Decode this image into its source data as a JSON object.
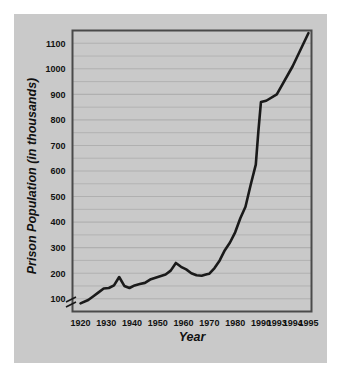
{
  "figure": {
    "background_color": "#ffffff",
    "panel_color": "#c9c9c9",
    "plot_background_color": "#ffffff",
    "frame_color": "#4a4a4a",
    "gridline_color": "#b0b0b0",
    "line_color": "#1a1a1a",
    "axis_break_note": "y-axis broken below 100"
  },
  "chart_data": {
    "type": "line",
    "title": "",
    "xlabel": "Year",
    "ylabel": "Prison Population (in thousands)",
    "xlim": [
      1920,
      1995
    ],
    "ylim": [
      50,
      1150
    ],
    "grid": true,
    "grid_interval": 50,
    "legend": "none",
    "y_tick_labels": [
      "1100",
      "1000",
      "900",
      "800",
      "700",
      "600",
      "500",
      "400",
      "300",
      "200",
      "100"
    ],
    "y_ticks": [
      1100,
      1000,
      900,
      800,
      700,
      600,
      500,
      400,
      300,
      200,
      100
    ],
    "x_tick_labels": [
      "1920",
      "1930",
      "1940",
      "1950",
      "1960",
      "1970",
      "1980",
      "1990",
      "1993",
      "1994",
      "1995"
    ],
    "x_ticks": [
      1920,
      1930,
      1940,
      1950,
      1960,
      1970,
      1980,
      1990,
      1993,
      1994,
      1995
    ],
    "x_axis_scale_note": "non-uniform: 1920-1990 evenly spaced by decade, then 1993, 1994, 1995 spaced as single years",
    "series": [
      {
        "name": "Prison Population",
        "x": [
          1920,
          1923,
          1925,
          1927,
          1929,
          1931,
          1933,
          1935,
          1937,
          1939,
          1941,
          1943,
          1945,
          1947,
          1950,
          1953,
          1955,
          1957,
          1959,
          1961,
          1963,
          1965,
          1967,
          1969,
          1970,
          1972,
          1974,
          1976,
          1978,
          1980,
          1982,
          1984,
          1986,
          1988,
          1989,
          1990,
          1991,
          1993,
          1994,
          1995
        ],
        "y": [
          82,
          95,
          110,
          125,
          140,
          142,
          152,
          185,
          150,
          142,
          152,
          158,
          162,
          175,
          185,
          195,
          210,
          240,
          225,
          215,
          200,
          192,
          190,
          196,
          198,
          220,
          250,
          290,
          320,
          360,
          415,
          460,
          545,
          625,
          755,
          870,
          875,
          900,
          1010,
          1140
        ]
      }
    ]
  }
}
